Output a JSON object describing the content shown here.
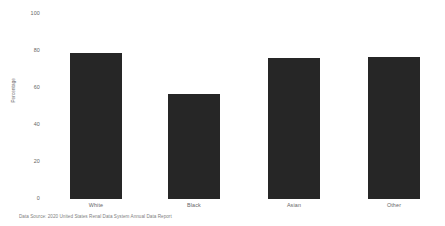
{
  "figure": {
    "background_color": "#ffffff",
    "bar_color": "#262626",
    "tick_color": "#666666",
    "source_note": "Data Source: 2020 United States Renal Data System Annual Data Report"
  },
  "chart_data": {
    "type": "bar",
    "title": "",
    "subtitle": "",
    "xlabel": "",
    "ylabel": "Percentage",
    "categories": [
      "White",
      "Black",
      "Asian",
      "Other"
    ],
    "values": [
      79,
      57,
      76,
      77
    ],
    "ylim": [
      0,
      100
    ],
    "yticks": [
      0,
      20,
      40,
      60,
      80,
      100
    ],
    "ytick_labels": [
      "0",
      "20",
      "40",
      "60",
      "80",
      "100"
    ],
    "grid": false,
    "legend": null,
    "annotations": [
      "Data Source: 2020 United States Renal Data System Annual Data Report"
    ]
  }
}
